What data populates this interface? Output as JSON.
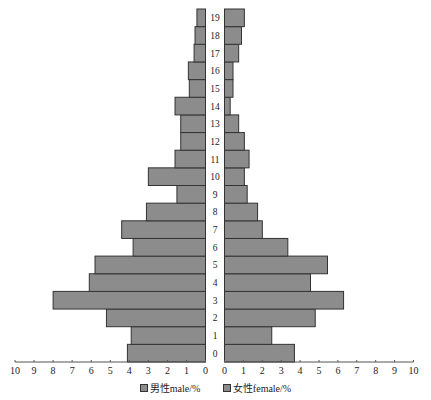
{
  "chart_data": {
    "type": "bar",
    "orientation": "horizontal",
    "subtype": "population-pyramid",
    "title": "",
    "categories": [
      "0",
      "1",
      "2",
      "3",
      "4",
      "5",
      "6",
      "7",
      "8",
      "9",
      "10",
      "11",
      "12",
      "13",
      "14",
      "15",
      "16",
      "17",
      "18",
      "19"
    ],
    "series": [
      {
        "name": "男性male/%",
        "side": "left",
        "values": [
          4.1,
          3.9,
          5.2,
          8.0,
          6.1,
          5.8,
          3.8,
          4.4,
          3.1,
          1.5,
          3.0,
          1.6,
          1.3,
          1.3,
          1.6,
          0.85,
          0.9,
          0.6,
          0.55,
          0.45
        ]
      },
      {
        "name": "女性female/%",
        "side": "right",
        "values": [
          3.7,
          2.5,
          4.8,
          6.3,
          4.55,
          5.45,
          3.35,
          2.0,
          1.75,
          1.2,
          1.05,
          1.3,
          1.05,
          0.75,
          0.3,
          0.45,
          0.45,
          0.75,
          0.9,
          1.05
        ]
      }
    ],
    "xlabel": "",
    "ylabel": "",
    "x_ticks_left": [
      "10",
      "9",
      "8",
      "7",
      "6",
      "5",
      "4",
      "3",
      "2",
      "1",
      "0"
    ],
    "x_ticks_right": [
      "0",
      "1",
      "2",
      "3",
      "4",
      "5",
      "6",
      "7",
      "8",
      "9",
      "10"
    ],
    "xlim": [
      0,
      10
    ],
    "grid": false,
    "legend_position": "bottom",
    "bar_color": "#8c8c8c"
  },
  "legend": {
    "male": "男性male/%",
    "female": "女性female/%"
  }
}
